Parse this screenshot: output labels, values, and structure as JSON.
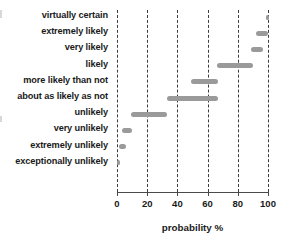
{
  "chart_data": {
    "type": "bar",
    "orientation": "horizontal",
    "title": "",
    "subtitle": "",
    "xlabel": "probability  %",
    "ylabel": "",
    "xlim": [
      0,
      100
    ],
    "xticks": [
      0,
      20,
      40,
      60,
      80,
      100
    ],
    "xticklabels": [
      "0",
      "20",
      "40",
      "60",
      "80",
      "100"
    ],
    "grid": "vertical-dashed",
    "legend": "none",
    "bar_color": "#9a9a9a",
    "grid_color": "#3d3d3d",
    "axis_color": "#4a4a4a",
    "categories": [
      "virtually certain",
      "extremely likely",
      "very likely",
      "likely",
      "more likely than not",
      "about as likely as not",
      "unlikely",
      "very unlikely",
      "extremely unlikely",
      "exceptionally unlikely"
    ],
    "ranges": [
      {
        "category": "virtually certain",
        "start": 99,
        "end": 100
      },
      {
        "category": "extremely likely",
        "start": 92,
        "end": 100
      },
      {
        "category": "very likely",
        "start": 89,
        "end": 97
      },
      {
        "category": "likely",
        "start": 66,
        "end": 90
      },
      {
        "category": "more likely than not",
        "start": 49,
        "end": 67
      },
      {
        "category": "about as likely as not",
        "start": 33,
        "end": 67
      },
      {
        "category": "unlikely",
        "start": 9,
        "end": 33
      },
      {
        "category": "very unlikely",
        "start": 3,
        "end": 10
      },
      {
        "category": "extremely unlikely",
        "start": 1,
        "end": 6
      },
      {
        "category": "exceptionally unlikely",
        "start": 0,
        "end": 2
      }
    ]
  },
  "axis": {
    "x_title": "probability  %",
    "ticks": [
      {
        "value": 0,
        "label": "0"
      },
      {
        "value": 20,
        "label": "20"
      },
      {
        "value": 40,
        "label": "40"
      },
      {
        "value": 60,
        "label": "60"
      },
      {
        "value": 80,
        "label": "80"
      },
      {
        "value": 100,
        "label": "100"
      }
    ]
  }
}
